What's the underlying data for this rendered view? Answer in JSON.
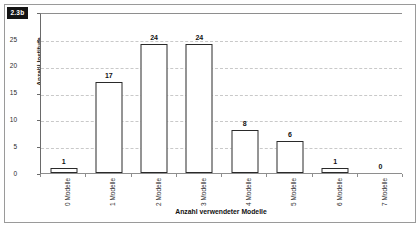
{
  "figure": {
    "badge": "2.3b"
  },
  "chart_data": {
    "type": "bar",
    "title": "",
    "xlabel": "Anzahl verwendeter Modelle",
    "ylabel": "Anzahl Institute",
    "categories": [
      "0 Modelle",
      "1 Modelle",
      "2 Modelle",
      "3 Modelle",
      "4 Modelle",
      "5 Modelle",
      "6 Modelle",
      "7 Modelle"
    ],
    "values": [
      1,
      17,
      24,
      24,
      8,
      6,
      1,
      0
    ],
    "value_labels": [
      "1",
      "17",
      "24",
      "24",
      "8",
      "6",
      "1",
      "0"
    ],
    "ylim": [
      0,
      30
    ],
    "yticks": [
      0,
      5,
      10,
      15,
      20,
      25,
      30
    ],
    "ytick_labels": [
      "0",
      "5",
      "10",
      "15",
      "20",
      "25",
      "30"
    ],
    "grid": true,
    "legend": false,
    "bar_fill": "#ffffff",
    "bar_outline": "#2a2a2a",
    "gridline_color": "#c9c9c9"
  }
}
